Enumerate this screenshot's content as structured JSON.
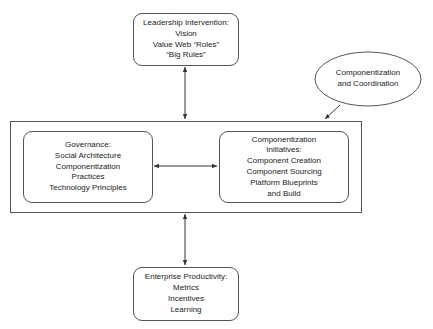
{
  "diagram": {
    "leadership": {
      "lines": [
        "Leadership Intervention:",
        "Vision",
        "Value Web “Roles”",
        "“Big Rules”"
      ]
    },
    "coordination": {
      "lines": [
        "Componentization",
        "and Coordination"
      ]
    },
    "governance": {
      "lines": [
        "Governance:",
        "Social Architecture",
        "Componentization",
        "Practices",
        "Technology Principles"
      ]
    },
    "initiatives": {
      "lines": [
        "Componentization",
        "Initiatives:",
        "Component Creation",
        "Component Sourcing",
        "Platform Blueprints",
        "and Build"
      ]
    },
    "productivity": {
      "lines": [
        "Enterprise Productivity:",
        "Metrics",
        "Incentives",
        "Learning"
      ]
    },
    "connections": [
      {
        "from": "leadership",
        "to": "outer-frame",
        "type": "bidirectional"
      },
      {
        "from": "governance",
        "to": "initiatives",
        "type": "bidirectional"
      },
      {
        "from": "outer-frame",
        "to": "productivity",
        "type": "bidirectional"
      },
      {
        "from": "coordination",
        "to": "outer-frame",
        "type": "directed"
      }
    ],
    "colors": {
      "stroke": "#555555",
      "text": "#222222",
      "background": "#ffffff"
    }
  }
}
